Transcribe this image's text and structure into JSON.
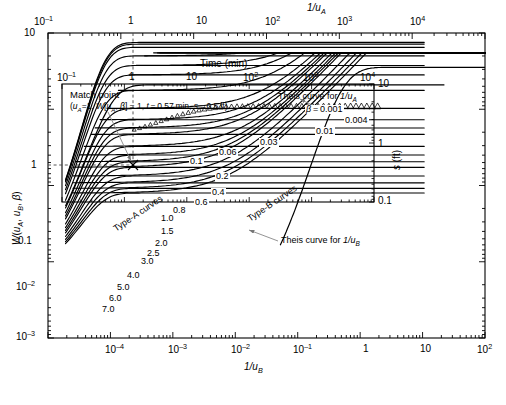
{
  "figure": {
    "kind": "neuman-type-curves",
    "background": "#ffffff",
    "line_color": "#000000",
    "annotation_color": "#808080"
  },
  "axes": {
    "top": {
      "name": "1/uA",
      "label_html": "1/u<sub>A</sub>",
      "label_plain": "1/uA",
      "ticks": [
        "10⁻¹",
        "1",
        "10",
        "10²",
        "10³",
        "10⁴"
      ],
      "range": [
        -1,
        5
      ],
      "scale": "log"
    },
    "bottom": {
      "name": "1/uB",
      "label_html": "1/u<sub>B</sub>",
      "label_plain": "1/uB",
      "ticks": [
        "10⁻⁴",
        "10⁻³",
        "10⁻²",
        "10⁻¹",
        "1",
        "10",
        "10²"
      ],
      "range": [
        -5,
        2
      ],
      "scale": "log"
    },
    "left": {
      "name": "W",
      "label_plain": "W(uA, uB, β)",
      "ticks": [
        "10",
        "1",
        "0.1",
        "10⁻²",
        "10⁻³"
      ],
      "range": [
        -3,
        1
      ],
      "scale": "log"
    },
    "inner_top": {
      "name": "time",
      "label": "Time (min)",
      "ticks": [
        "10⁻¹",
        "1",
        "10",
        "10²",
        "10³",
        "10⁴"
      ],
      "range": [
        -1,
        4
      ],
      "scale": "log"
    },
    "inner_right": {
      "name": "drawdown",
      "label_plain": "s (ft)",
      "ticks": [
        "10",
        "1",
        "0.1"
      ],
      "range": [
        -1,
        1
      ],
      "scale": "log"
    }
  },
  "annotations": {
    "match_point_title": "Match point",
    "match_point_values": "(uₐ=1, W[uₐ, β] = 1, t = 0.57 min, s = 0.5 ft)",
    "theis_a": "Theis curve for 1/u",
    "theis_a_sub": "A",
    "theis_b": "Theis curve for 1/u",
    "theis_b_sub": "B",
    "type_a": "Type-A curves",
    "type_b": "Type-B curves",
    "beta_prefix": "β = "
  },
  "chart_data": {
    "type": "line",
    "xlabel": "1/uB",
    "ylabel": "W(uA, uB, β)",
    "xlim": [
      -5,
      2
    ],
    "ylim": [
      -3,
      1
    ],
    "grid": false,
    "legend": "inline curve labels",
    "beta_labels_typeB": [
      "0.001",
      "0.004",
      "0.01",
      "0.03",
      "0.06",
      "0.1",
      "0.2"
    ],
    "beta_labels_typeA": [
      "0.2",
      "0.4",
      "0.6",
      "0.8",
      "1.0",
      "1.5",
      "2.0",
      "2.5",
      "3.0",
      "4.0",
      "5.0",
      "6.0",
      "7.0"
    ],
    "beta_values": [
      0.001,
      0.004,
      0.01,
      0.03,
      0.06,
      0.1,
      0.2,
      0.4,
      0.6,
      0.8,
      1.0,
      1.5,
      2.0,
      2.5,
      3.0,
      4.0,
      5.0,
      6.0,
      7.0
    ],
    "match_point": {
      "uA": 1,
      "W": 1,
      "t_min": 0.57,
      "s_ft": 0.5
    },
    "series": [
      {
        "name": "Theis curve for 1/uA",
        "note": "upper-left envelope, early-time"
      },
      {
        "name": "Theis curve for 1/uB",
        "note": "lower-right rising branch, late-time"
      },
      {
        "name": "Type-A curves",
        "note": "early-time family, plateau at W set by β"
      },
      {
        "name": "Type-B curves",
        "note": "late-time family converging to Theis 1/uB"
      },
      {
        "name": "data points",
        "note": "open triangles plotted along β≈0.06 Type-A segment"
      }
    ]
  }
}
